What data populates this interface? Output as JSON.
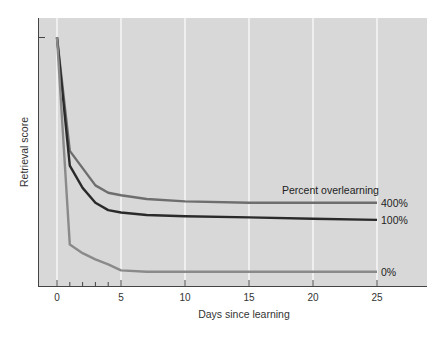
{
  "chart_data": {
    "type": "line",
    "title": "",
    "xlabel": "Days since learning",
    "ylabel": "Retrieval score",
    "xlim": [
      -1.5,
      28.5
    ],
    "x_ticks": [
      0,
      5,
      10,
      15,
      20,
      25
    ],
    "x_tick_labels": [
      "0",
      "5",
      "10",
      "15",
      "20",
      "25"
    ],
    "x_minor_ticks": [
      1,
      2,
      3,
      4
    ],
    "ylim": [
      0,
      100
    ],
    "y_ticks": [
      100
    ],
    "y_tick_labels": [
      ""
    ],
    "grid": "vertical white lines at major x ticks",
    "legend_title": "Percent overlearning",
    "legend_position": "right, inline labels at line ends",
    "series": [
      {
        "name": "400%",
        "color": "#6e6e6e",
        "x": [
          0,
          1,
          2,
          3,
          4,
          5,
          7,
          10,
          15,
          20,
          25
        ],
        "values": [
          100,
          54,
          47,
          40,
          37,
          36,
          34.5,
          33.5,
          33,
          33,
          33
        ]
      },
      {
        "name": "100%",
        "color": "#2a2a2a",
        "x": [
          0,
          1,
          2,
          3,
          4,
          5,
          7,
          10,
          15,
          20,
          25
        ],
        "values": [
          100,
          48,
          39,
          33,
          30,
          29,
          28,
          27.5,
          27,
          26.5,
          26
        ]
      },
      {
        "name": "0%",
        "color": "#8a8a8a",
        "x": [
          0,
          1,
          2,
          3,
          4,
          5,
          7,
          10,
          15,
          20,
          25
        ],
        "values": [
          100,
          16,
          12.5,
          10,
          8,
          5.5,
          5,
          5,
          5,
          5,
          5
        ]
      }
    ]
  }
}
